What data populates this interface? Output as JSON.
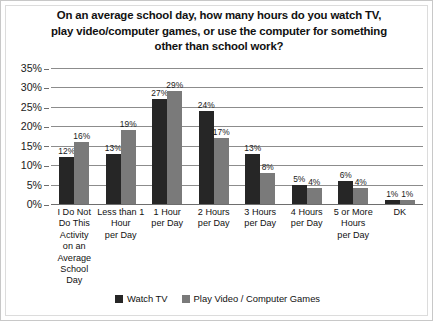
{
  "chart_data": {
    "type": "bar",
    "title_lines": [
      "On an average school day, how many hours do you watch TV,",
      "play video/computer games, or use the computer for something",
      "other than school work?"
    ],
    "xlabel": "",
    "ylabel": "",
    "ylim": [
      0,
      35
    ],
    "ytick_values": [
      0,
      5,
      10,
      15,
      20,
      25,
      30,
      35
    ],
    "ytick_labels": [
      "0%",
      "5%",
      "10%",
      "15%",
      "20%",
      "25%",
      "30%",
      "35%"
    ],
    "grid": true,
    "legend_position": "bottom",
    "categories": [
      "I Do Not Do This Activity on an Average School Day",
      "Less than 1 Hour per Day",
      "1 Hour per Day",
      "2 Hours per Day",
      "3 Hours per Day",
      "4 Hours per Day",
      "5 or More Hours per Day",
      "DK"
    ],
    "category_lines": [
      [
        "I Do Not",
        "Do This",
        "Activity",
        "on an",
        "Average",
        "School",
        "Day"
      ],
      [
        "Less than 1",
        "Hour",
        "per Day"
      ],
      [
        "1 Hour",
        "per Day"
      ],
      [
        "2 Hours",
        "per Day"
      ],
      [
        "3 Hours",
        "per Day"
      ],
      [
        "4 Hours",
        "per Day"
      ],
      [
        "5 or More",
        "Hours",
        "per Day"
      ],
      [
        "DK"
      ]
    ],
    "series": [
      {
        "name": "Watch TV",
        "color": "#262626",
        "values": [
          12,
          13,
          27,
          24,
          13,
          5,
          6,
          1
        ],
        "labels": [
          "12%",
          "13%",
          "27%",
          "24%",
          "13%",
          "5%",
          "6%",
          "1%"
        ]
      },
      {
        "name": "Play Video / Computer Games",
        "color": "#7a7a7a",
        "values": [
          16,
          19,
          29,
          17,
          8,
          4,
          4,
          1
        ],
        "labels": [
          "16%",
          "19%",
          "29%",
          "17%",
          "8%",
          "4%",
          "4%",
          "1%"
        ]
      }
    ]
  },
  "legend": {
    "items": [
      {
        "label": "Watch TV",
        "color": "#262626"
      },
      {
        "label": "Play Video / Computer Games",
        "color": "#7a7a7a"
      }
    ]
  }
}
